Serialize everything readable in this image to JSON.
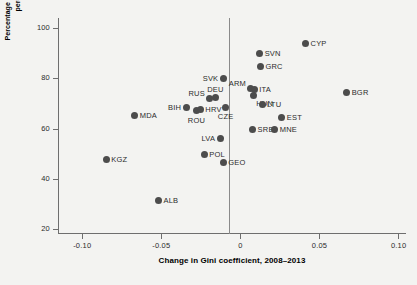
{
  "chart_data": {
    "type": "scatter",
    "title": "",
    "xlabel": "Change in Gini coefficient, 2008–2013",
    "ylabel": "Percentage of people thinking inequality has increased minus percentage thinking it has decreased in 2015",
    "xlim": [
      -0.115,
      0.105
    ],
    "ylim": [
      18,
      104
    ],
    "xticks": [
      -0.1,
      -0.05,
      0,
      0.05,
      0.1
    ],
    "xtick_labels": [
      "-0.10",
      "-0.05",
      "0",
      "0.05",
      "0.10"
    ],
    "yticks": [
      20,
      40,
      60,
      80,
      100
    ],
    "ytick_labels": [
      "20",
      "40",
      "60",
      "80",
      "100"
    ],
    "grid": false,
    "legend": null,
    "reference_line_x": 0,
    "marker_color": "#4c4c4c",
    "background_color": "#f3f3f1",
    "points": [
      {
        "label": "KGZ",
        "x": -0.0845,
        "y": 47.5,
        "label_side": "right"
      },
      {
        "label": "MDA",
        "x": -0.0665,
        "y": 65.0,
        "label_side": "right"
      },
      {
        "label": "ALB",
        "x": -0.0515,
        "y": 31.5,
        "label_side": "right"
      },
      {
        "label": "BIH",
        "x": -0.034,
        "y": 68.5,
        "label_side": "left"
      },
      {
        "label": "ROU",
        "x": -0.0275,
        "y": 67.0,
        "label_side": "below"
      },
      {
        "label": "HRV",
        "x": -0.025,
        "y": 67.5,
        "label_side": "right"
      },
      {
        "label": "RUS",
        "x": -0.019,
        "y": 72.0,
        "label_side": "upper-left"
      },
      {
        "label": "POL",
        "x": -0.0225,
        "y": 49.5,
        "label_side": "right"
      },
      {
        "label": "DEU",
        "x": -0.0155,
        "y": 72.5,
        "label_side": "above"
      },
      {
        "label": "LVA",
        "x": -0.0125,
        "y": 56.0,
        "label_side": "left"
      },
      {
        "label": "GEO",
        "x": -0.0105,
        "y": 46.5,
        "label_side": "right"
      },
      {
        "label": "CZE",
        "x": -0.009,
        "y": 68.5,
        "label_side": "below"
      },
      {
        "label": "SVK",
        "x": -0.0105,
        "y": 80.0,
        "label_side": "left"
      },
      {
        "label": "ARM",
        "x": 0.007,
        "y": 76.0,
        "label_side": "upper-left"
      },
      {
        "label": "ITA",
        "x": 0.009,
        "y": 75.5,
        "label_side": "right"
      },
      {
        "label": "HUN",
        "x": 0.0085,
        "y": 73.0,
        "label_side": "below-right"
      },
      {
        "label": "SRB",
        "x": 0.008,
        "y": 59.5,
        "label_side": "right"
      },
      {
        "label": "SVN",
        "x": 0.0125,
        "y": 90.0,
        "label_side": "right"
      },
      {
        "label": "GRC",
        "x": 0.013,
        "y": 84.5,
        "label_side": "right"
      },
      {
        "label": "LTU",
        "x": 0.014,
        "y": 69.5,
        "label_side": "right"
      },
      {
        "label": "MNE",
        "x": 0.022,
        "y": 59.5,
        "label_side": "right"
      },
      {
        "label": "EST",
        "x": 0.0265,
        "y": 64.5,
        "label_side": "right"
      },
      {
        "label": "CYP",
        "x": 0.0415,
        "y": 94.0,
        "label_side": "right"
      },
      {
        "label": "BGR",
        "x": 0.0675,
        "y": 74.5,
        "label_side": "right"
      }
    ]
  }
}
